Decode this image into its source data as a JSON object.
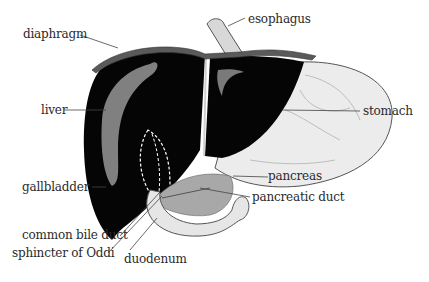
{
  "diagram": {
    "labels": {
      "diaphragm": "diaphragm",
      "esophagus": "esophagus",
      "liver": "liver",
      "stomach": "stomach",
      "gallbladder": "gallbladder",
      "pancreas": "pancreas",
      "pancreatic_duct": "pancreatic duct",
      "common_bile_duct": "common bile duct",
      "sphincter_of_oddi": "sphincter of Oddi",
      "duodenum": "duodenum"
    },
    "colors": {
      "liver": "#050505",
      "liver_highlight": "#808080",
      "stomach": "#ececec",
      "diaphragm": "#5a5a5a",
      "pancreas": "#a8a8a8",
      "duodenum": "#e6e6e6",
      "leader_line": "#444444",
      "label_text": "#2a2a2a"
    }
  }
}
